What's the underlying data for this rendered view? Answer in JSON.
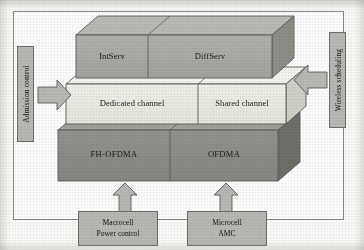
{
  "diagram": {
    "type": "3d-layered-block-diagram",
    "colors": {
      "top_layer_face": "#a9a9a4",
      "top_layer_topface": "#bcbcb7",
      "top_layer_sideface": "#8f8f8a",
      "middle_layer_face": "#eeeee7",
      "middle_layer_topface": "#f6f6f1",
      "middle_layer_sideface": "#d2d2ca",
      "bottom_layer_face": "#8d8d89",
      "bottom_layer_topface": "#a3a39e",
      "bottom_layer_sideface": "#707069",
      "arrow_fill": "#b9b9b5",
      "box_fill": "#b9b9b5",
      "outline": "#5d5d5a",
      "frame_border": "#8a8a86",
      "background": "#ffffff",
      "text": "#1b1b1b"
    },
    "layers": [
      {
        "name": "top-layer",
        "level": "qos-model",
        "blocks": [
          {
            "id": "intserv",
            "label": "IntServ"
          },
          {
            "id": "diffserv",
            "label": "DiffServ"
          }
        ]
      },
      {
        "name": "middle-layer",
        "level": "channel-type",
        "blocks": [
          {
            "id": "dedicated-channel",
            "label": "Dedicated channel"
          },
          {
            "id": "shared-channel",
            "label": "Shared channel"
          }
        ]
      },
      {
        "name": "bottom-layer",
        "level": "access-scheme",
        "blocks": [
          {
            "id": "fh-ofdma",
            "label": "FH-OFDMA"
          },
          {
            "id": "ofdma",
            "label": "OFDMA"
          }
        ]
      }
    ],
    "side_annotations": [
      {
        "id": "admission-control",
        "label": "Admission control",
        "position": "left",
        "arrow_direction": "right",
        "orientation": "vertical"
      },
      {
        "id": "wireless-scheduling",
        "label": "Wireless scheduling",
        "position": "right",
        "arrow_direction": "left",
        "orientation": "vertical"
      }
    ],
    "bottom_annotations": [
      {
        "id": "macrocell-power-control",
        "line1": "Macrocell",
        "line2": "Power control",
        "arrow_direction": "up",
        "targets": "fh-ofdma"
      },
      {
        "id": "microcell-amc",
        "line1": "Microcell",
        "line2": "AMC",
        "arrow_direction": "up",
        "targets": "ofdma"
      }
    ]
  }
}
